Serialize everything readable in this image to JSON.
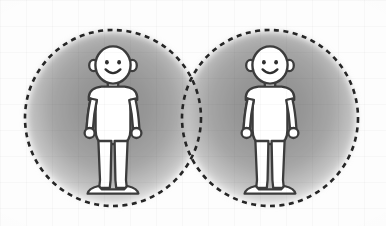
{
  "illustration": {
    "title": "Two stick figures inside overlapping dashed circles",
    "canvas": {
      "width": 386,
      "height": 226
    },
    "background": {
      "name": "paper-background",
      "color": "#fdfdfd",
      "texture": "faint-grid"
    },
    "circles": [
      {
        "name": "left-dashed-circle",
        "cx": 113,
        "cy": 118,
        "r": 88,
        "stroke_color": "#262626",
        "stroke_width": 2.6,
        "dash_pattern": "5 4.5",
        "fill_center_color": "#8f8f8f",
        "fill_edge_color": "#fafafa"
      },
      {
        "name": "right-dashed-circle",
        "cx": 270,
        "cy": 118,
        "r": 88,
        "stroke_color": "#262626",
        "stroke_width": 2.6,
        "dash_pattern": "5 4.5",
        "fill_center_color": "#8f8f8f",
        "fill_edge_color": "#fafafa"
      }
    ],
    "figures": [
      {
        "name": "left-person-figure",
        "label": "Person 1",
        "center_x": 113,
        "top_y": 48,
        "bottom_y": 194,
        "body_fill": "#ffffff",
        "outline_color": "#3a3a3a",
        "expression": "smiling",
        "features": [
          "head",
          "ears",
          "eyes",
          "smile",
          "torso",
          "arms",
          "hands",
          "legs",
          "feet"
        ]
      },
      {
        "name": "right-person-figure",
        "label": "Person 2",
        "center_x": 270,
        "top_y": 48,
        "bottom_y": 194,
        "body_fill": "#ffffff",
        "outline_color": "#3a3a3a",
        "expression": "smiling",
        "features": [
          "head",
          "ears",
          "eyes",
          "smile",
          "torso",
          "arms",
          "hands",
          "legs",
          "feet"
        ]
      }
    ]
  }
}
